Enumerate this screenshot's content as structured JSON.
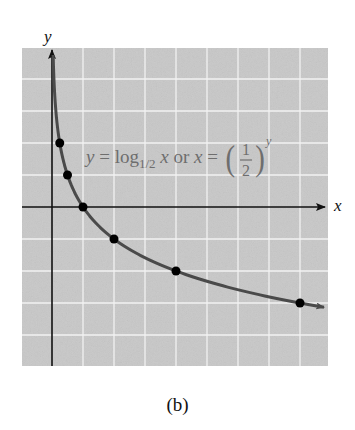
{
  "chart_data": {
    "type": "line",
    "title": "",
    "equation": {
      "lhs": "y = log",
      "base": "1/2",
      "mid": "x or x =",
      "frac_num": "1",
      "frac_den": "2",
      "exp": "y"
    },
    "xlabel": "x",
    "ylabel": "y",
    "x_domain_px_unit": 31,
    "xlim": [
      -1,
      9
    ],
    "ylim": [
      -5,
      5
    ],
    "grid": true,
    "function": "y = log_{1/2}(x)",
    "points": [
      {
        "x": 0.25,
        "y": 2
      },
      {
        "x": 0.5,
        "y": 1
      },
      {
        "x": 1,
        "y": 0
      },
      {
        "x": 2,
        "y": -1
      },
      {
        "x": 4,
        "y": -2
      },
      {
        "x": 8,
        "y": -3
      }
    ],
    "colors": {
      "grid_bg": "#c8c8c8",
      "grid_line": "#f2f2f2",
      "curve": "#4a4a4a",
      "axes": "#111111",
      "points": "#000000",
      "equation_text": "#6e6e6e"
    }
  },
  "caption": "(b)"
}
